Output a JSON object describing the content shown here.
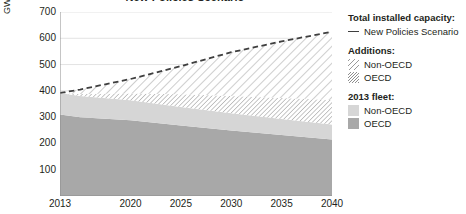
{
  "chart_data": {
    "type": "area",
    "title": "New Policies Scenario",
    "xlabel": "",
    "ylabel": "GW",
    "xlim": [
      2013,
      2040
    ],
    "ylim": [
      0,
      700
    ],
    "grid": true,
    "legend_position": "right",
    "x_tick_labels": [
      "2013",
      "2020",
      "2025",
      "2030",
      "2035",
      "2040"
    ],
    "x_ticks": [
      2013,
      2020,
      2025,
      2030,
      2035,
      2040
    ],
    "y_tick_labels": [
      "100",
      "200",
      "300",
      "400",
      "500",
      "600",
      "700"
    ],
    "y_ticks": [
      100,
      200,
      300,
      400,
      500,
      600,
      700
    ],
    "x": [
      2013,
      2015,
      2020,
      2025,
      2030,
      2035,
      2040
    ],
    "series": [
      {
        "name": "OECD",
        "group": "2013 fleet",
        "stack_order": 1,
        "fill": "solid-dark-gray",
        "color": "#a8a8a8",
        "values": [
          310,
          300,
          288,
          268,
          249,
          232,
          215
        ]
      },
      {
        "name": "Non-OECD",
        "group": "2013 fleet",
        "stack_order": 2,
        "fill": "solid-light-gray",
        "color": "#d6d6d6",
        "values": [
          82,
          80,
          76,
          71,
          66,
          61,
          57
        ]
      },
      {
        "name": "OECD",
        "group": "Additions",
        "stack_order": 3,
        "fill": "dense-hatch",
        "color": "#8e8e8e",
        "values": [
          0,
          8,
          26,
          48,
          65,
          80,
          93
        ]
      },
      {
        "name": "Non-OECD",
        "group": "Additions",
        "stack_order": 4,
        "fill": "sparse-hatch",
        "color": "#9a9a9a",
        "values": [
          0,
          17,
          55,
          107,
          167,
          215,
          260
        ]
      }
    ],
    "total_line": {
      "name": "New Policies Scenario",
      "style": "dashed",
      "color": "#3f3f3f",
      "values": [
        392,
        405,
        445,
        494,
        547,
        588,
        625
      ]
    }
  },
  "axis": {
    "y_label": "GW"
  },
  "legend": {
    "groups": [
      {
        "heading": "Total installed capacity:",
        "items": [
          {
            "label": "New Policies Scenario",
            "swatch": "dashed-line-swatch"
          }
        ]
      },
      {
        "heading": "Additions:",
        "items": [
          {
            "label": "Non-OECD",
            "swatch": "sparse-hatch-swatch"
          },
          {
            "label": "OECD",
            "swatch": "dense-hatch-swatch"
          }
        ]
      },
      {
        "heading": "2013 fleet:",
        "items": [
          {
            "label": "Non-OECD",
            "swatch": "light-gray-swatch"
          },
          {
            "label": "OECD",
            "swatch": "dark-gray-swatch"
          }
        ]
      }
    ]
  },
  "colors": {
    "fleet_oecd": "#a8a8a8",
    "fleet_non_oecd": "#d6d6d6",
    "additions_oecd": "#8e8e8e",
    "additions_non_oecd": "#9a9a9a",
    "total_line": "#3f3f3f",
    "grid": "#e3e3e3",
    "axis": "#8c8c8c",
    "text": "#231f20"
  }
}
